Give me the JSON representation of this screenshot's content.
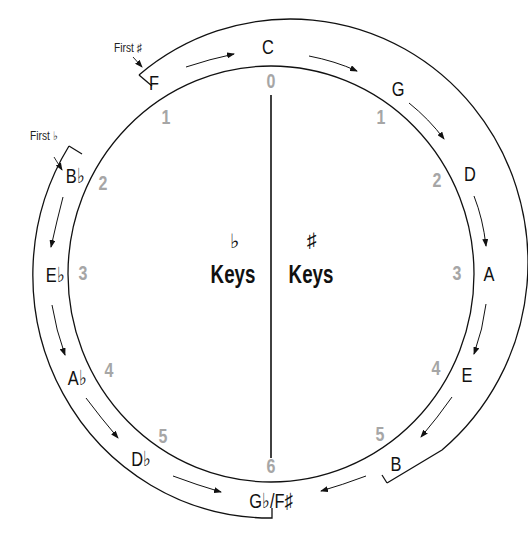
{
  "diagram": {
    "colors": {
      "line": "#111111",
      "number": "#a6a6a6",
      "text": "#111111"
    },
    "top_key": {
      "name": "C",
      "count": "0"
    },
    "bottom_key": {
      "name": "G♭/F♯",
      "count": "6"
    },
    "sharp_keys": [
      {
        "name": "G",
        "count": "1"
      },
      {
        "name": "D",
        "count": "2"
      },
      {
        "name": "A",
        "count": "3"
      },
      {
        "name": "E",
        "count": "4"
      },
      {
        "name": "B",
        "count": "5"
      }
    ],
    "flat_keys": [
      {
        "name": "F",
        "count": "1"
      },
      {
        "name": "B♭",
        "count": "2"
      },
      {
        "name": "E♭",
        "count": "3"
      },
      {
        "name": "A♭",
        "count": "4"
      },
      {
        "name": "D♭",
        "count": "5"
      }
    ],
    "annotations": {
      "first_sharp": "First ♯",
      "first_flat": "First ♭"
    },
    "center": {
      "flat_symbol": "♭",
      "flat_label": "Keys",
      "sharp_symbol": "♯",
      "sharp_label": "Keys"
    }
  }
}
